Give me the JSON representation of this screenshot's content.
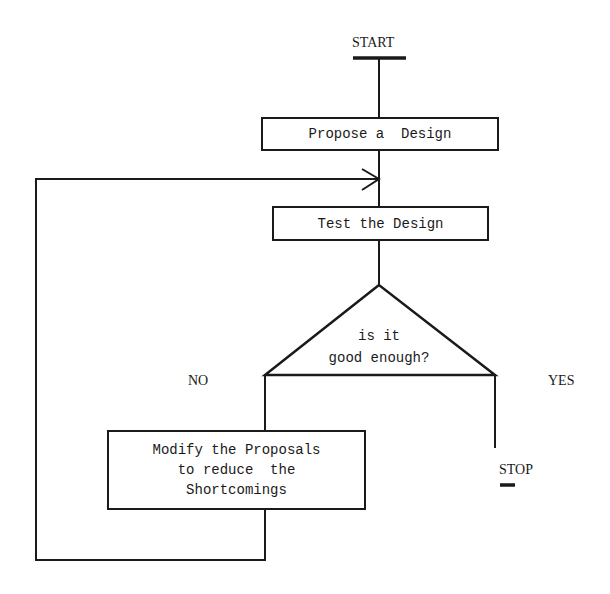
{
  "flowchart": {
    "start": {
      "label": "START"
    },
    "stop": {
      "label": "STOP"
    },
    "steps": [
      {
        "id": "propose",
        "label": "Propose a  Design"
      },
      {
        "id": "test",
        "label": "Test the Design"
      },
      {
        "id": "modify",
        "label": "Modify the Proposals\nto reduce  the\nShortcomings"
      }
    ],
    "decision": {
      "line1": "is it",
      "line2": "good enough?",
      "no_label": "NO",
      "yes_label": "YES"
    },
    "colors": {
      "stroke": "#1a1a1a",
      "background": "#ffffff"
    }
  }
}
